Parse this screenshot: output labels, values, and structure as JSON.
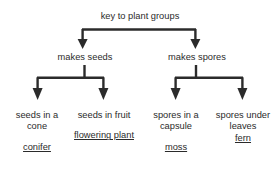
{
  "diagram": {
    "type": "tree-key",
    "title": "key to plant groups",
    "line_color": "#2b2b2b",
    "text_color": "#2b2b2b",
    "background_color": "#ffffff",
    "root": {
      "label": "key to plant groups"
    },
    "level2": [
      {
        "label": "makes seeds"
      },
      {
        "label": "makes spores"
      }
    ],
    "leaves": [
      {
        "description": "seeds in\na cone",
        "term": "conifer"
      },
      {
        "description": "seeds in\nfruit",
        "term": "flowering\nplant"
      },
      {
        "description": "spores in\na capsule",
        "term": "moss"
      },
      {
        "description": "spores\nunder\nleaves",
        "term": "fern"
      }
    ]
  }
}
